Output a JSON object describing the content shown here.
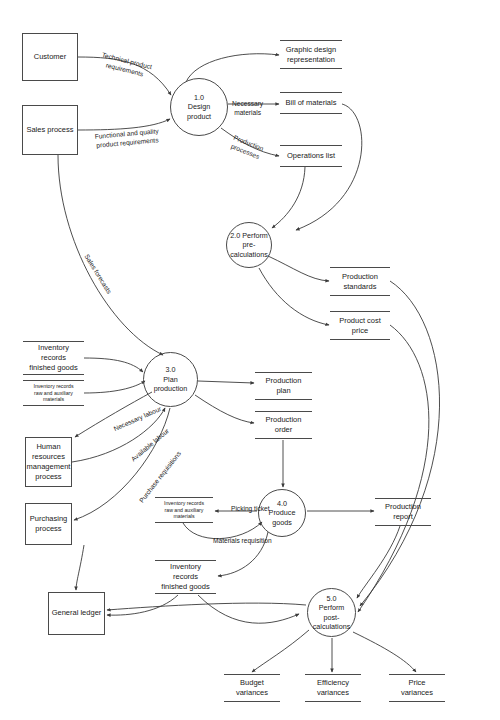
{
  "diagram": {
    "entities": [
      {
        "id": "customer",
        "label": "Customer",
        "x": 22,
        "y": 33,
        "w": 56,
        "h": 48
      },
      {
        "id": "sales-process",
        "label": "Sales process",
        "x": 22,
        "y": 105,
        "w": 56,
        "h": 50
      },
      {
        "id": "hr-process",
        "label": "Human\nresources\nmanagement\nprocess",
        "x": 25,
        "y": 437,
        "w": 47,
        "h": 50
      },
      {
        "id": "purchasing-process",
        "label": "Purchasing\nprocess",
        "x": 25,
        "y": 503,
        "w": 47,
        "h": 42
      },
      {
        "id": "general-ledger",
        "label": "General ledger",
        "x": 48,
        "y": 592,
        "w": 57,
        "h": 43
      }
    ],
    "processes": [
      {
        "id": "p1",
        "label": "1.0\nDesign\nproduct",
        "x": 170,
        "y": 78,
        "d": 58
      },
      {
        "id": "p2",
        "label": "2.0 Perform\npre-\ncalculations",
        "x": 226,
        "y": 222,
        "d": 46
      },
      {
        "id": "p3",
        "label": "3.0\nPlan\nproduction",
        "x": 143,
        "y": 352,
        "d": 55
      },
      {
        "id": "p4",
        "label": "4.0\nProduce goods",
        "x": 258,
        "y": 489,
        "d": 48
      },
      {
        "id": "p5",
        "label": "5.0\nPerform post-\ncalculations",
        "x": 307,
        "y": 588,
        "d": 49
      }
    ],
    "datastores": [
      {
        "id": "graphic-design",
        "label": "Graphic design\nrepresentation",
        "x": 280,
        "y": 40,
        "w": 62,
        "h": 29,
        "small": false
      },
      {
        "id": "bill-of-materials",
        "label": "Bill of materials",
        "x": 280,
        "y": 92,
        "w": 62,
        "h": 22,
        "small": false
      },
      {
        "id": "operations-list",
        "label": "Operations list",
        "x": 280,
        "y": 145,
        "w": 62,
        "h": 22,
        "small": false
      },
      {
        "id": "production-standards",
        "label": "Production\nstandards",
        "x": 330,
        "y": 267,
        "w": 60,
        "h": 29,
        "small": false
      },
      {
        "id": "product-cost-price",
        "label": "Product cost\nprice",
        "x": 330,
        "y": 311,
        "w": 60,
        "h": 29,
        "small": false
      },
      {
        "id": "inventory-finished-top",
        "label": "Inventory\nrecords\nfinished goods",
        "x": 23,
        "y": 341,
        "w": 61,
        "h": 34,
        "small": false
      },
      {
        "id": "inventory-raw-left",
        "label": "Inventory records\nraw and auxiliary\nmaterials",
        "x": 23,
        "y": 380,
        "w": 61,
        "h": 26,
        "small": true
      },
      {
        "id": "production-plan",
        "label": "Production\nplan",
        "x": 255,
        "y": 372,
        "w": 57,
        "h": 28,
        "small": false
      },
      {
        "id": "production-order",
        "label": "Production\norder",
        "x": 255,
        "y": 411,
        "w": 57,
        "h": 28,
        "small": false
      },
      {
        "id": "inventory-raw-mid",
        "label": "Inventory records\nraw and auxiliary\nmaterials",
        "x": 155,
        "y": 497,
        "w": 58,
        "h": 26,
        "small": true
      },
      {
        "id": "production-report",
        "label": "Production\nreport",
        "x": 375,
        "y": 498,
        "w": 56,
        "h": 28,
        "small": false
      },
      {
        "id": "inventory-finished-bottom",
        "label": "Inventory\nrecords\nfinished goods",
        "x": 155,
        "y": 560,
        "w": 61,
        "h": 34,
        "small": false
      },
      {
        "id": "budget-variances",
        "label": "Budget\nvariances",
        "x": 224,
        "y": 674,
        "w": 56,
        "h": 28,
        "small": false
      },
      {
        "id": "efficiency-variances",
        "label": "Efficiency\nvariances",
        "x": 305,
        "y": 674,
        "w": 56,
        "h": 28,
        "small": false
      },
      {
        "id": "price-variances",
        "label": "Price\nvariances",
        "x": 389,
        "y": 674,
        "w": 56,
        "h": 28,
        "small": false
      }
    ],
    "flow_labels": [
      {
        "id": "technical-product-requirements",
        "text": "Technical product\nrequirements",
        "x": 100,
        "y": 57,
        "rotate": 14
      },
      {
        "id": "functional-quality-requirements",
        "text": "Functional and quality\nproduct requirements",
        "x": 95,
        "y": 130,
        "rotate": -5
      },
      {
        "id": "necessary-materials",
        "text": "Necessary\nmaterials",
        "x": 232,
        "y": 100,
        "rotate": 0
      },
      {
        "id": "production-processes",
        "text": "Production\nprocesses",
        "x": 231,
        "y": 139,
        "rotate": 22
      },
      {
        "id": "sales-forecasts",
        "text": "Sales forecasts",
        "x": 75,
        "y": 270,
        "rotate": 58
      },
      {
        "id": "necessary-labour",
        "text": "Necessary labour",
        "x": 112,
        "y": 415,
        "rotate": -24
      },
      {
        "id": "available-labour",
        "text": "Available labour",
        "x": 127,
        "y": 441,
        "rotate": -40
      },
      {
        "id": "purchase-requisitions",
        "text": "Purchase requisitions",
        "x": 129,
        "y": 473,
        "rotate": -52
      },
      {
        "id": "picking-ticket",
        "text": "Picking ticket",
        "x": 231,
        "y": 505,
        "rotate": 0
      },
      {
        "id": "materials-requisition",
        "text": "Materials requisition",
        "x": 213,
        "y": 537,
        "rotate": 0
      }
    ]
  }
}
